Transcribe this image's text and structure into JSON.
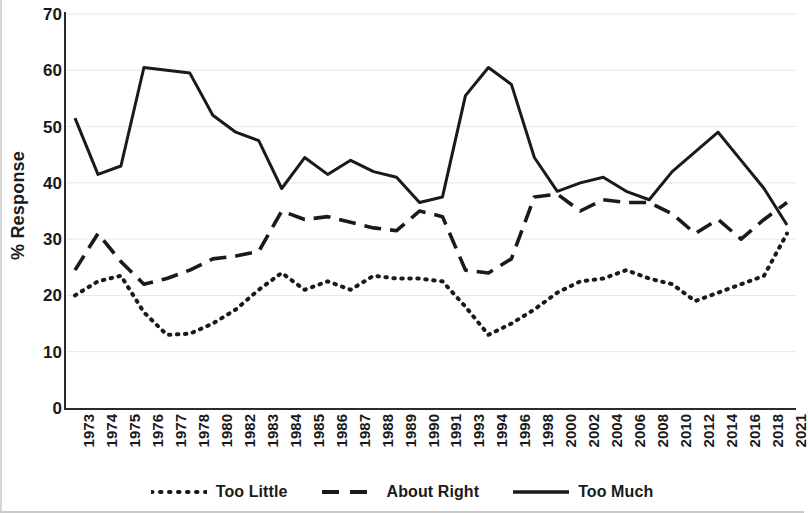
{
  "chart_data": {
    "type": "line",
    "title": "",
    "xlabel": "",
    "ylabel": "% Response",
    "ylim": [
      0,
      70
    ],
    "ytick_step": 10,
    "yticks": [
      70,
      60,
      50,
      40,
      30,
      20,
      10,
      0
    ],
    "grid": true,
    "legend_position": "bottom",
    "categories": [
      "1973",
      "1974",
      "1975",
      "1976",
      "1977",
      "1978",
      "1980",
      "1982",
      "1983",
      "1984",
      "1985",
      "1986",
      "1987",
      "1988",
      "1989",
      "1990",
      "1991",
      "1993",
      "1994",
      "1996",
      "1998",
      "2000",
      "2002",
      "2004",
      "2006",
      "2008",
      "2010",
      "2012",
      "2014",
      "2016",
      "2018",
      "2021"
    ],
    "series": [
      {
        "name": "Too Little",
        "style": "dotted",
        "color": "#1a1a1a",
        "values": [
          20.0,
          22.5,
          23.5,
          17.0,
          13.0,
          13.2,
          15.0,
          17.5,
          21.0,
          24.0,
          21.0,
          22.5,
          21.0,
          23.5,
          23.0,
          23.0,
          22.5,
          18.0,
          13.0,
          15.0,
          17.5,
          20.5,
          22.5,
          23.0,
          24.5,
          23.0,
          22.0,
          19.0,
          20.5,
          22.0,
          23.5,
          31.0
        ]
      },
      {
        "name": "About Right",
        "style": "dashed",
        "color": "#1a1a1a",
        "values": [
          24.5,
          31.0,
          26.0,
          22.0,
          23.0,
          24.5,
          26.5,
          27.0,
          27.8,
          35.0,
          33.5,
          34.0,
          33.0,
          32.0,
          31.5,
          35.0,
          34.0,
          24.5,
          24.0,
          26.5,
          37.5,
          38.0,
          35.0,
          37.0,
          36.5,
          36.5,
          34.5,
          31.0,
          33.5,
          30.0,
          33.5,
          36.5
        ]
      },
      {
        "name": "Too Much",
        "style": "solid",
        "color": "#1a1a1a",
        "values": [
          51.5,
          41.5,
          43.0,
          60.5,
          60.0,
          59.5,
          52.0,
          49.0,
          47.5,
          39.0,
          44.5,
          41.5,
          44.0,
          42.0,
          41.0,
          36.5,
          37.5,
          55.5,
          60.5,
          57.5,
          44.5,
          38.5,
          40.0,
          41.0,
          38.5,
          37.0,
          42.0,
          45.5,
          49.0,
          44.0,
          39.0,
          32.5
        ]
      }
    ]
  },
  "legend": {
    "items": [
      {
        "label": "Too Little",
        "swatch": "dotted-line-swatch"
      },
      {
        "label": "About Right",
        "swatch": "dashed-line-swatch"
      },
      {
        "label": "Too Much",
        "swatch": "solid-line-swatch"
      }
    ]
  },
  "axes": {
    "y_title": "% Response"
  }
}
